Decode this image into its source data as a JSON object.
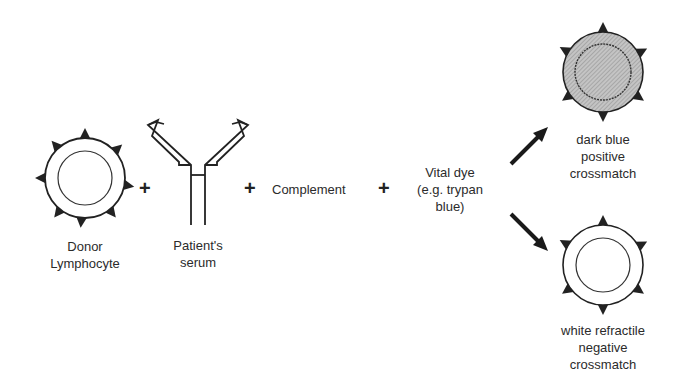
{
  "diagram": {
    "donor_cell": {
      "label_line1": "Donor",
      "label_line2": "Lymphocyte"
    },
    "antibody": {
      "label_line1": "Patient's",
      "label_line2": "serum"
    },
    "complement": {
      "label": "Complement"
    },
    "vital_dye": {
      "label_line1": "Vital dye",
      "label_line2": "(e.g. trypan",
      "label_line3": "blue)"
    },
    "positive": {
      "label_line1": "dark blue",
      "label_line2": "positive",
      "label_line3": "crossmatch"
    },
    "negative": {
      "label_line1": "white refractile",
      "label_line2": "negative",
      "label_line3": "crossmatch"
    },
    "operators": {
      "plus": "+"
    },
    "colors": {
      "ink": "#222222",
      "stained_fill": "#b8b8b8",
      "background": "#ffffff"
    }
  }
}
